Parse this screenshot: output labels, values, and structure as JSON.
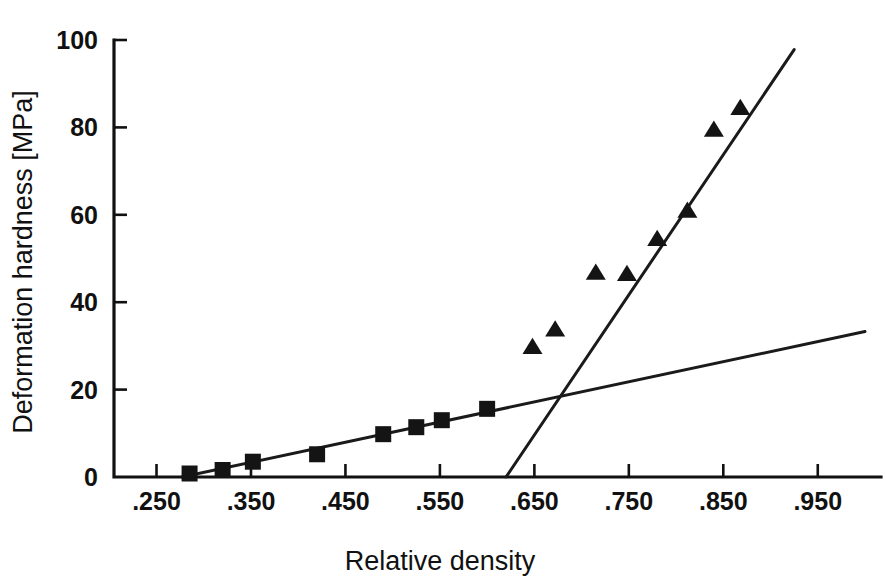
{
  "chart_data": {
    "type": "scatter",
    "title": "",
    "xlabel": "Relative density",
    "ylabel": "Deformation hardness [MPa]",
    "xlim": [
      0.205,
      1.0
    ],
    "ylim": [
      0,
      100
    ],
    "grid": false,
    "legend": "none",
    "x_tick_labels": [
      ".250",
      ".350",
      ".450",
      ".550",
      ".650",
      ".750",
      ".850",
      ".950"
    ],
    "x_tick_values": [
      0.25,
      0.35,
      0.45,
      0.55,
      0.65,
      0.75,
      0.85,
      0.95
    ],
    "y_tick_labels": [
      "0",
      "20",
      "40",
      "60",
      "80",
      "100"
    ],
    "y_tick_values": [
      0,
      20,
      40,
      60,
      80,
      100
    ],
    "series": [
      {
        "name": "square-series",
        "marker": "square",
        "color": "#141414",
        "points": [
          {
            "x": 0.285,
            "y": 0.8
          },
          {
            "x": 0.32,
            "y": 1.6
          },
          {
            "x": 0.352,
            "y": 3.5
          },
          {
            "x": 0.42,
            "y": 5.2
          },
          {
            "x": 0.49,
            "y": 9.8
          },
          {
            "x": 0.525,
            "y": 11.4
          },
          {
            "x": 0.552,
            "y": 13.0
          },
          {
            "x": 0.6,
            "y": 15.6
          }
        ]
      },
      {
        "name": "triangle-series",
        "marker": "triangle",
        "color": "#141414",
        "points": [
          {
            "x": 0.648,
            "y": 29.8
          },
          {
            "x": 0.672,
            "y": 33.8
          },
          {
            "x": 0.715,
            "y": 46.8
          },
          {
            "x": 0.748,
            "y": 46.5
          },
          {
            "x": 0.78,
            "y": 54.5
          },
          {
            "x": 0.812,
            "y": 61.0
          },
          {
            "x": 0.84,
            "y": 79.5
          },
          {
            "x": 0.868,
            "y": 84.5
          }
        ]
      }
    ],
    "fit_lines": [
      {
        "name": "shallow-fit-line",
        "x1": 0.277,
        "y1": 0.0,
        "x2": 1.0,
        "y2": 33.3
      },
      {
        "name": "steep-fit-line",
        "x1": 0.62,
        "y1": 0.0,
        "x2": 0.925,
        "y2": 97.8
      }
    ]
  }
}
